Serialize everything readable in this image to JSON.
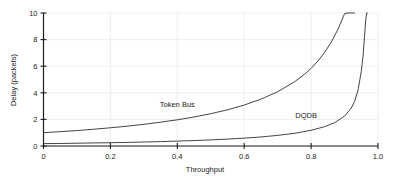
{
  "chart_data": {
    "type": "line",
    "title": "",
    "xlabel": "Throughput",
    "ylabel": "Delay (packets)",
    "xlim": [
      0,
      1.0
    ],
    "ylim": [
      0,
      10
    ],
    "grid": true,
    "legend_position": "inline-annotation",
    "xticks": [
      "0",
      "0.2",
      "0.4",
      "0.6",
      "0.8",
      "1.0"
    ],
    "xtick_values": [
      0,
      0.2,
      0.4,
      0.6,
      0.8,
      1.0
    ],
    "yticks": [
      "0",
      "2",
      "4",
      "6",
      "8",
      "10"
    ],
    "ytick_values": [
      0,
      2,
      4,
      6,
      8,
      10
    ],
    "annotations": [
      {
        "text": "Token Bus",
        "x": 0.4,
        "y": 2.95
      },
      {
        "text": "DQDB",
        "x": 0.785,
        "y": 2.1
      }
    ],
    "series": [
      {
        "name": "Token Bus",
        "x": [
          0.0,
          0.05,
          0.1,
          0.15,
          0.2,
          0.25,
          0.3,
          0.35,
          0.4,
          0.45,
          0.5,
          0.55,
          0.6,
          0.65,
          0.7,
          0.75,
          0.78,
          0.8,
          0.82,
          0.84,
          0.86,
          0.88,
          0.9,
          0.91,
          0.92,
          0.925,
          0.93
        ],
        "y": [
          1.0,
          1.08,
          1.16,
          1.26,
          1.37,
          1.49,
          1.63,
          1.79,
          1.97,
          2.18,
          2.43,
          2.72,
          3.08,
          3.52,
          4.08,
          4.82,
          5.38,
          5.84,
          6.38,
          7.02,
          7.8,
          8.76,
          9.95,
          10.0,
          10.0,
          10.0,
          10.0
        ]
      },
      {
        "name": "DQDB",
        "x": [
          0.0,
          0.05,
          0.1,
          0.15,
          0.2,
          0.25,
          0.3,
          0.35,
          0.4,
          0.45,
          0.5,
          0.55,
          0.6,
          0.65,
          0.7,
          0.75,
          0.8,
          0.84,
          0.87,
          0.9,
          0.92,
          0.93,
          0.94,
          0.95,
          0.955,
          0.96,
          0.963,
          0.966,
          0.968
        ],
        "y": [
          0.18,
          0.19,
          0.21,
          0.23,
          0.25,
          0.27,
          0.3,
          0.33,
          0.37,
          0.41,
          0.46,
          0.52,
          0.59,
          0.68,
          0.8,
          0.95,
          1.18,
          1.45,
          1.75,
          2.25,
          2.85,
          3.35,
          4.15,
          5.6,
          6.7,
          8.3,
          9.4,
          10.0,
          10.0
        ]
      }
    ]
  }
}
